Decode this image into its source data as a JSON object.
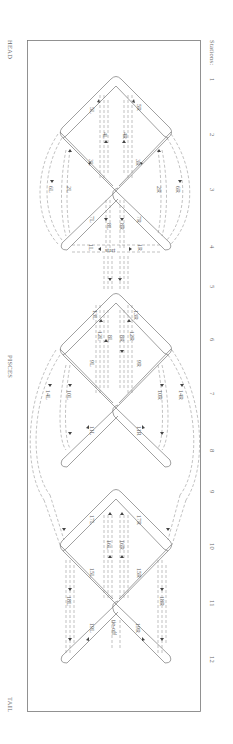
{
  "figure": {
    "title": "PISCES",
    "head_label": "HEAD",
    "tail_label": "TAIL",
    "stations_label": "Stations:",
    "stations": [
      "1",
      "2",
      "3",
      "4",
      "5",
      "6",
      "7",
      "8",
      "9",
      "10",
      "11",
      "12"
    ],
    "markers": {
      "start": "start",
      "tie_off": "tie-off"
    },
    "diamond1_labels": [
      "5L",
      "5R",
      "4L",
      "4R",
      "3L",
      "3R",
      "6L",
      "2L",
      "2R",
      "6R",
      "7L",
      "7R",
      "8L",
      "8R",
      "1L",
      "1R"
    ],
    "diamond2_labels": [
      "13L",
      "13R",
      "12L",
      "8L",
      "8R",
      "12R",
      "9L",
      "9R",
      "14L",
      "10L",
      "10R",
      "14R",
      "11L",
      "11R"
    ],
    "diamond3_labels": [
      "17L",
      "17R",
      "16L",
      "16R",
      "15L",
      "15R",
      "18L",
      "18R",
      "19L",
      "19R"
    ]
  }
}
